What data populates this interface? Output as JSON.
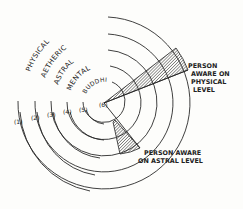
{
  "diagram": {
    "levels": [
      {
        "number": "(1)",
        "name": "PHYSICAL"
      },
      {
        "number": "(2)",
        "name": "AETHERIC"
      },
      {
        "number": "(3)",
        "name": "ASTRAL"
      },
      {
        "number": "(4)",
        "name": "MENTAL"
      },
      {
        "number": "(5)",
        "name": "BUDDHIC"
      },
      {
        "number": "(6)",
        "name": ""
      }
    ],
    "annotations": {
      "physical": [
        "PERSON",
        "AWARE ON",
        "PHYSICAL",
        "LEVEL"
      ],
      "astral": [
        "PERSON AWARE",
        "ON ASTRAL LEVEL"
      ]
    },
    "colors": {
      "line": "#2a2a2a",
      "background": "#fdfdfb"
    }
  }
}
